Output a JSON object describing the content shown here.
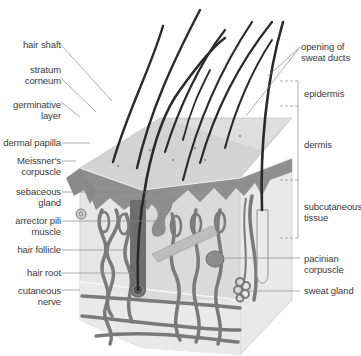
{
  "figure": {
    "colors": {
      "background": "#ffffff",
      "epidermis": "#8f8f8f",
      "dermis": "#d6d6d6",
      "subcutaneous": "#e4e4e4",
      "vessel": "#7a7a7a",
      "hair": "#2a2a2a",
      "leader_line": "#8a8a8a",
      "surface": "#cfcfcf"
    }
  },
  "labels_left": [
    {
      "id": "hair-shaft",
      "text": "hair shaft"
    },
    {
      "id": "stratum-corneum",
      "text": "stratum\ncorneum"
    },
    {
      "id": "germinative-layer",
      "text": "germinative\nlayer"
    },
    {
      "id": "dermal-papilla",
      "text": "dermal papilla"
    },
    {
      "id": "meissners-corpuscle",
      "text": "Meissner's\ncorpuscle"
    },
    {
      "id": "sebaceous-gland",
      "text": "sebaceous\ngland"
    },
    {
      "id": "arrector-pili-muscle",
      "text": "arrector pili\nmuscle"
    },
    {
      "id": "hair-follicle",
      "text": "hair follicle"
    },
    {
      "id": "hair-root",
      "text": "hair root"
    },
    {
      "id": "cutaneous-nerve",
      "text": "cutaneous\nnerve"
    }
  ],
  "labels_right": [
    {
      "id": "opening-of-sweat-ducts",
      "text": "opening of\nsweat ducts"
    },
    {
      "id": "epidermis",
      "text": "epidermis"
    },
    {
      "id": "dermis",
      "text": "dermis"
    },
    {
      "id": "subcutaneous-tissue",
      "text": "subcutaneous\ntissue"
    },
    {
      "id": "pacinian-corpuscle",
      "text": "pacinian\ncorpuscle"
    },
    {
      "id": "sweat-gland",
      "text": "sweat gland"
    }
  ]
}
